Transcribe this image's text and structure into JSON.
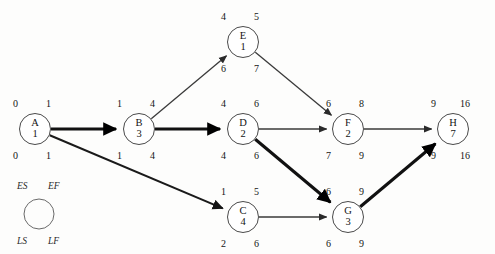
{
  "diagram": {
    "type": "activity-on-node-network",
    "legend": {
      "es": "ES",
      "ef": "EF",
      "ls": "LS",
      "lf": "LF"
    },
    "nodes": [
      {
        "id": "A",
        "label": "A",
        "duration": "1",
        "es": "0",
        "ef": "1",
        "ls": "0",
        "lf": "1",
        "cx": 35,
        "cy": 129,
        "r": 15.5,
        "critical": true
      },
      {
        "id": "B",
        "label": "B",
        "duration": "3",
        "es": "1",
        "ef": "4",
        "ls": "1",
        "lf": "4",
        "cx": 139,
        "cy": 129,
        "r": 15.5,
        "critical": true
      },
      {
        "id": "E",
        "label": "E",
        "duration": "1",
        "es": "4",
        "ef": "5",
        "ls": "6",
        "lf": "7",
        "cx": 243,
        "cy": 42,
        "r": 15.5,
        "critical": false
      },
      {
        "id": "D",
        "label": "D",
        "duration": "2",
        "es": "4",
        "ef": "6",
        "ls": "4",
        "lf": "6",
        "cx": 243,
        "cy": 129,
        "r": 15.5,
        "critical": true
      },
      {
        "id": "C",
        "label": "C",
        "duration": "4",
        "es": "1",
        "ef": "5",
        "ls": "2",
        "lf": "6",
        "cx": 243,
        "cy": 217,
        "r": 15.5,
        "critical": false
      },
      {
        "id": "F",
        "label": "F",
        "duration": "2",
        "es": "6",
        "ef": "8",
        "ls": "7",
        "lf": "9",
        "cx": 348,
        "cy": 129,
        "r": 15.5,
        "critical": false
      },
      {
        "id": "G",
        "label": "G",
        "duration": "3",
        "es": "6",
        "ef": "9",
        "ls": "6",
        "lf": "9",
        "cx": 348,
        "cy": 217,
        "r": 15.5,
        "critical": true
      },
      {
        "id": "H",
        "label": "H",
        "duration": "7",
        "es": "9",
        "ef": "16",
        "ls": "9",
        "lf": "16",
        "cx": 453,
        "cy": 129,
        "r": 15.5,
        "critical": true
      }
    ],
    "edges": [
      {
        "from": "A",
        "to": "B",
        "weight": "bold"
      },
      {
        "from": "A",
        "to": "C",
        "weight": "med"
      },
      {
        "from": "B",
        "to": "E",
        "weight": "thin"
      },
      {
        "from": "B",
        "to": "D",
        "weight": "bold"
      },
      {
        "from": "E",
        "to": "F",
        "weight": "thin"
      },
      {
        "from": "D",
        "to": "F",
        "weight": "thin"
      },
      {
        "from": "D",
        "to": "G",
        "weight": "bold"
      },
      {
        "from": "C",
        "to": "G",
        "weight": "thin"
      },
      {
        "from": "F",
        "to": "H",
        "weight": "thin"
      },
      {
        "from": "G",
        "to": "H",
        "weight": "bold"
      }
    ],
    "critical_path": [
      "A",
      "B",
      "D",
      "G",
      "H"
    ],
    "project_duration": "16"
  }
}
